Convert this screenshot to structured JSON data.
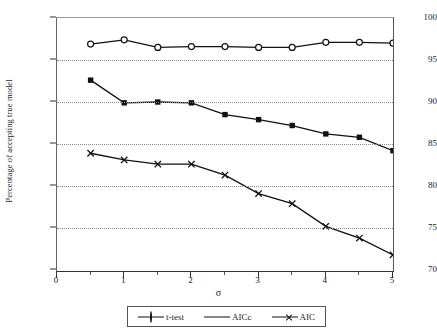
{
  "chart_data": {
    "type": "line",
    "title": "",
    "xlabel": "σ",
    "ylabel": "Percentage of accepting true model",
    "xlim": [
      0,
      5
    ],
    "ylim": [
      70,
      100
    ],
    "xticks": [
      "0",
      "1",
      "2",
      "3",
      "4",
      "5"
    ],
    "xtick_values": [
      0,
      1,
      2,
      3,
      4,
      5
    ],
    "xtick_minor_values": [
      0.5,
      1.5,
      2.5,
      3.5,
      4.5
    ],
    "yticks": [
      "70",
      "75",
      "80",
      "85",
      "90",
      "95",
      "100"
    ],
    "ytick_values": [
      70,
      75,
      80,
      85,
      90,
      95,
      100
    ],
    "grid": "horizontal-dotted",
    "legend_position": "bottom",
    "x": [
      0.5,
      1.0,
      1.5,
      2.0,
      2.5,
      3.0,
      3.5,
      4.0,
      4.5,
      5.0
    ],
    "series": [
      {
        "name": "t-test",
        "marker": "open-circle",
        "values": [
          96.9,
          97.4,
          96.5,
          96.6,
          96.6,
          96.5,
          96.5,
          97.1,
          97.1,
          97.0
        ]
      },
      {
        "name": "AICc",
        "marker": "filled-square",
        "values": [
          92.6,
          89.9,
          90.0,
          89.9,
          88.5,
          87.9,
          87.2,
          86.2,
          85.8,
          84.2
        ]
      },
      {
        "name": "AIC",
        "marker": "x-cross",
        "values": [
          83.9,
          83.1,
          82.6,
          82.6,
          81.3,
          79.1,
          77.9,
          75.2,
          73.8,
          71.8
        ]
      }
    ],
    "colors": {
      "series_line": "#111111",
      "gridline": "#8a8a8a",
      "axis": "#333333",
      "background": "#ffffff"
    }
  },
  "legend": {
    "entries": [
      {
        "label": "t-test"
      },
      {
        "label": "AICc"
      },
      {
        "label": "AIC"
      }
    ]
  }
}
